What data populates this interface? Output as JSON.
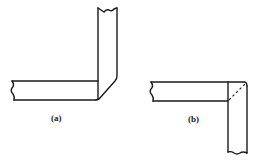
{
  "figure": {
    "panels": [
      {
        "id": "a",
        "label": "(a)",
        "description": "L-shaped joint with mitred outer corner, vertical member rising upward"
      },
      {
        "id": "b",
        "label": "(b)",
        "description": "L-shaped joint with rounded outer corner and dashed mitre line, vertical member extending downward"
      }
    ]
  }
}
